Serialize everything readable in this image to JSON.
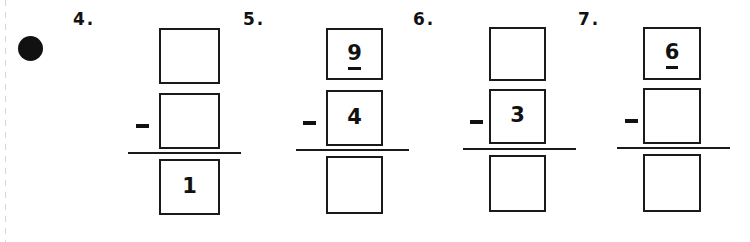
{
  "worksheet": {
    "bullet_marker": "filled-circle",
    "ink_color": "#111111",
    "paper_color": "#ffffff",
    "problems": [
      {
        "number_label": "4.",
        "operator": "−",
        "minuend": "",
        "subtrahend": "",
        "difference": "1",
        "minuend_underlined": false,
        "subtrahend_underlined": false,
        "difference_underlined": false
      },
      {
        "number_label": "5.",
        "operator": "−",
        "minuend": "9",
        "subtrahend": "4",
        "difference": "",
        "minuend_underlined": true,
        "subtrahend_underlined": false,
        "difference_underlined": false
      },
      {
        "number_label": "6.",
        "operator": "−",
        "minuend": "",
        "subtrahend": "3",
        "difference": "",
        "minuend_underlined": false,
        "subtrahend_underlined": false,
        "difference_underlined": false
      },
      {
        "number_label": "7.",
        "operator": "−",
        "minuend": "6",
        "subtrahend": "",
        "difference": "",
        "minuend_underlined": true,
        "subtrahend_underlined": false,
        "difference_underlined": false
      }
    ]
  }
}
